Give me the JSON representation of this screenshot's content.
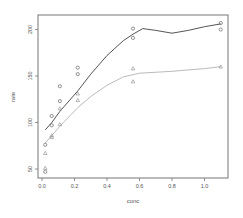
{
  "chart_data": {
    "type": "scatter",
    "title": "",
    "xlabel": "conc",
    "ylabel": "rate",
    "xlim": [
      0.0,
      1.1
    ],
    "ylim": [
      45,
      210
    ],
    "x_ticks": [
      "0.0",
      "0.2",
      "0.4",
      "0.6",
      "0.8",
      "1.0"
    ],
    "y_ticks": [
      "50",
      "100",
      "150",
      "200"
    ],
    "grid": false,
    "legend": "none",
    "series": [
      {
        "name": "treated",
        "marker": "circle",
        "color": "#555555",
        "points": [
          [
            0.02,
            76
          ],
          [
            0.02,
            47
          ],
          [
            0.06,
            97
          ],
          [
            0.06,
            107
          ],
          [
            0.11,
            123
          ],
          [
            0.11,
            139
          ],
          [
            0.22,
            159
          ],
          [
            0.22,
            152
          ],
          [
            0.56,
            191
          ],
          [
            0.56,
            201
          ],
          [
            1.1,
            207
          ],
          [
            1.1,
            200
          ]
        ],
        "smooth_line": [
          [
            0.02,
            92
          ],
          [
            0.06,
            100
          ],
          [
            0.11,
            112
          ],
          [
            0.22,
            134
          ],
          [
            0.3,
            152
          ],
          [
            0.4,
            172
          ],
          [
            0.5,
            188
          ],
          [
            0.56,
            195
          ],
          [
            0.62,
            201
          ],
          [
            0.7,
            199
          ],
          [
            0.8,
            196
          ],
          [
            0.9,
            199
          ],
          [
            1.0,
            203
          ],
          [
            1.1,
            206
          ]
        ]
      },
      {
        "name": "untreated",
        "marker": "triangle",
        "color": "#bbbbbb",
        "points": [
          [
            0.02,
            67
          ],
          [
            0.02,
            51
          ],
          [
            0.06,
            84
          ],
          [
            0.06,
            86
          ],
          [
            0.11,
            98
          ],
          [
            0.11,
            115
          ],
          [
            0.22,
            131
          ],
          [
            0.22,
            124
          ],
          [
            0.56,
            144
          ],
          [
            0.56,
            158
          ],
          [
            1.1,
            160
          ]
        ],
        "smooth_line": [
          [
            0.02,
            78
          ],
          [
            0.06,
            86
          ],
          [
            0.11,
            96
          ],
          [
            0.22,
            116
          ],
          [
            0.3,
            128
          ],
          [
            0.4,
            140
          ],
          [
            0.5,
            149
          ],
          [
            0.6,
            153
          ],
          [
            0.8,
            155
          ],
          [
            1.0,
            158
          ],
          [
            1.1,
            160
          ]
        ]
      }
    ]
  }
}
